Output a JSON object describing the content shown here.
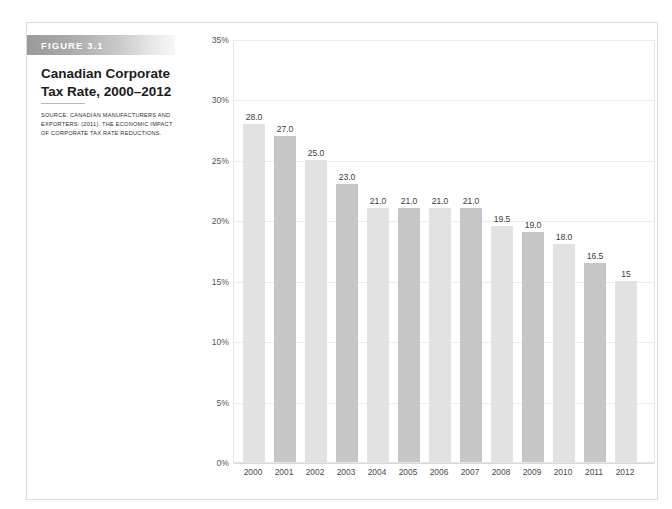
{
  "figure": {
    "badge_label": "FIGURE 3.1",
    "title": "Canadian Corporate Tax Rate, 2000–2012",
    "source": "SOURCE: CANADIAN MANUFACTURERS AND EXPORTERS. (2011). THE ECONOMIC IMPACT OF CORPORATE TAX RATE REDUCTIONS."
  },
  "colors": {
    "bar_light": "#e2e2e2",
    "bar_dark": "#c6c6c6",
    "gridline": "#ebebeb",
    "plot_border": "#e6e6e6",
    "badge_gradient_start": "#9a9a9a",
    "badge_gradient_end": "#f7f7f7",
    "frame_border": "#dcdcdc",
    "label_text": "#3b3b3b"
  },
  "chart_data": {
    "type": "bar",
    "title": "Canadian Corporate Tax Rate, 2000–2012",
    "xlabel": "",
    "ylabel": "",
    "ylim": [
      0,
      35
    ],
    "grid": true,
    "legend": "none",
    "ytick_labels": [
      "35%",
      "30%",
      "25%",
      "20%",
      "15%",
      "10%",
      "5%",
      "0%"
    ],
    "ytick_values": [
      35,
      30,
      25,
      20,
      15,
      10,
      5,
      0
    ],
    "categories": [
      "2000",
      "2001",
      "2002",
      "2003",
      "2004",
      "2005",
      "2006",
      "2007",
      "2008",
      "2009",
      "2010",
      "2011",
      "2012"
    ],
    "values": [
      28.0,
      27.0,
      25.0,
      23.0,
      21.0,
      21.0,
      21.0,
      21.0,
      19.5,
      19.0,
      18.0,
      16.5,
      15.0
    ],
    "data_labels": [
      "28.0",
      "27.0",
      "25.0",
      "23.0",
      "21.0",
      "21.0",
      "21.0",
      "21.0",
      "19.5",
      "19.0",
      "18.0",
      "16.5",
      "15"
    ],
    "bar_shades": [
      "light",
      "dark",
      "light",
      "dark",
      "light",
      "dark",
      "light",
      "dark",
      "light",
      "dark",
      "light",
      "dark",
      "light"
    ]
  }
}
